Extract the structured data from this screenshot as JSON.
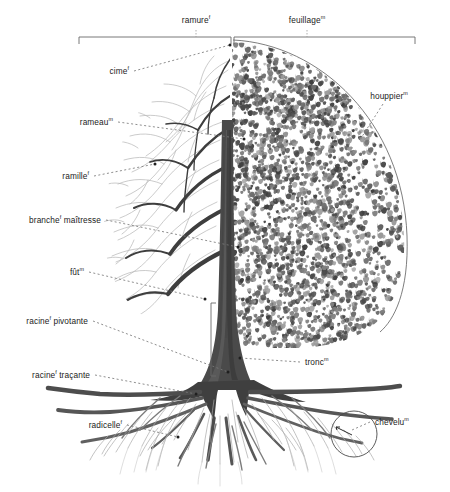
{
  "diagram": {
    "language": "fr",
    "background": "#ffffff",
    "ink": "#1b1b1b",
    "foliage_dark": "#4a4a4a",
    "foliage_mid": "#6e6e6e",
    "foliage_light": "#9a9a9a",
    "wood_dark": "#3a3a3a",
    "wood_light": "#b6b6b6",
    "leader_color": "#6a6a6a"
  },
  "labels": [
    {
      "id": "ramure",
      "text": "ramure",
      "gender": "f",
      "x": 196,
      "y": 20,
      "align": "c"
    },
    {
      "id": "feuillage",
      "text": "feuillage",
      "gender": "m",
      "x": 307,
      "y": 20,
      "align": "c"
    },
    {
      "id": "cime",
      "text": "cime",
      "gender": "f",
      "x": 129,
      "y": 71,
      "align": "r"
    },
    {
      "id": "houppier",
      "text": "houppier",
      "gender": "m",
      "x": 389,
      "y": 96,
      "align": "c"
    },
    {
      "id": "rameau",
      "text": "rameau",
      "gender": "m",
      "x": 113,
      "y": 122,
      "align": "r"
    },
    {
      "id": "ramille",
      "text": "ramille",
      "gender": "f",
      "x": 89,
      "y": 176,
      "align": "r"
    },
    {
      "id": "branche-maitresse",
      "text": "branche",
      "gender": "f",
      "x": 101,
      "y": 220,
      "align": "r",
      "text2": "maîtresse"
    },
    {
      "id": "fut",
      "text": "fût",
      "gender": "m",
      "x": 84,
      "y": 272,
      "align": "r"
    },
    {
      "id": "racine-pivotante",
      "text": "racine",
      "gender": "f",
      "x": 88,
      "y": 321,
      "align": "r",
      "text2": "pivotante"
    },
    {
      "id": "racine-tracante",
      "text": "racine",
      "gender": "f",
      "x": 90,
      "y": 375,
      "align": "r",
      "text2": "traçante"
    },
    {
      "id": "radicelle",
      "text": "radicelle",
      "gender": "f",
      "x": 122,
      "y": 425,
      "align": "r"
    },
    {
      "id": "tronc",
      "text": "tronc",
      "gender": "m",
      "x": 305,
      "y": 362,
      "align": "l"
    },
    {
      "id": "chevelu",
      "text": "chevelu",
      "gender": "m",
      "x": 375,
      "y": 422,
      "align": "l"
    }
  ],
  "brackets": [
    {
      "id": "ramure-bracket",
      "x1": 79,
      "x2": 231,
      "y": 37,
      "tick": 7,
      "label": "ramure"
    },
    {
      "id": "feuillage-bracket",
      "x1": 234,
      "x2": 415,
      "y": 37,
      "tick": 7,
      "label": "feuillage"
    },
    {
      "id": "fut-bracket",
      "x": 211,
      "y1": 303,
      "y2": 376,
      "tick": 5,
      "label": "fût",
      "orientation": "vertical"
    }
  ],
  "leaders": [
    {
      "id": "cime-leader",
      "from": [
        134,
        71
      ],
      "to": [
        230,
        45
      ],
      "dot": "end"
    },
    {
      "id": "houppier-leader",
      "from": [
        383,
        104
      ],
      "to": [
        361,
        140
      ],
      "dot": "none"
    },
    {
      "id": "rameau-leader",
      "from": [
        118,
        122
      ],
      "to": [
        244,
        139
      ],
      "dot": "end"
    },
    {
      "id": "ramille-leader",
      "from": [
        94,
        176
      ],
      "to": [
        155,
        164
      ],
      "dot": "end"
    },
    {
      "id": "branche-maitresse-leader",
      "from": [
        106,
        220
      ],
      "to": [
        238,
        247
      ],
      "dot": "end"
    },
    {
      "id": "fut-leader",
      "from": [
        89,
        272
      ],
      "to": [
        205,
        299
      ],
      "dot": "end"
    },
    {
      "id": "racine-pivotante-leader",
      "from": [
        93,
        321
      ],
      "to": [
        228,
        372
      ],
      "dot": "end"
    },
    {
      "id": "racine-tracante-leader",
      "from": [
        95,
        375
      ],
      "to": [
        196,
        394
      ],
      "dot": "end"
    },
    {
      "id": "radicelle-leader",
      "from": [
        127,
        425
      ],
      "to": [
        176,
        432
      ],
      "dot": "end"
    },
    {
      "id": "radicelle-leader-2",
      "from": [
        176,
        432
      ],
      "to": [
        178,
        437
      ],
      "dot": "none"
    },
    {
      "id": "tronc-leader",
      "from": [
        300,
        362
      ],
      "to": [
        240,
        358
      ],
      "dot": "end"
    },
    {
      "id": "chevelu-leader",
      "from": [
        370,
        422
      ],
      "to": [
        352,
        430
      ],
      "dot": "none"
    }
  ],
  "callout_circle": {
    "id": "chevelu-magnifier",
    "cx": 354,
    "cy": 434,
    "r": 23
  },
  "crown_arc": {
    "id": "houppier-outline",
    "cx": 258,
    "cy": 232,
    "rx": 152,
    "ry": 196
  }
}
